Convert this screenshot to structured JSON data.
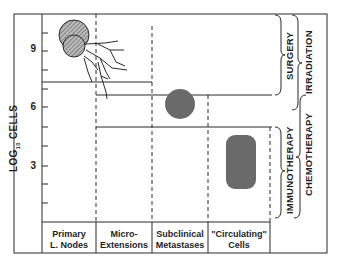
{
  "y_axis": {
    "label_main": "LOG",
    "label_sub": "10",
    "label_rest": " CELLS",
    "ticks": [
      "9",
      "6",
      "3"
    ]
  },
  "columns": [
    {
      "line1": "Primary",
      "line2": "L. Nodes"
    },
    {
      "line1": "Micro-",
      "line2": "Extensions"
    },
    {
      "line1": "Subclinical",
      "line2": "Metastases"
    },
    {
      "line1": "\"Circulating\"",
      "line2": "Cells"
    }
  ],
  "therapies": {
    "surgery": "SURGERY",
    "irradiation": "IRRADIATION",
    "immunotherapy": "IMMUNOTHERAPY",
    "chemotherapy": "CHEMOTHERAPY"
  },
  "colors": {
    "line": "#2a2a2a",
    "hatched_fill": "#8a8a8a",
    "solid_fill": "#6a6a6a"
  }
}
